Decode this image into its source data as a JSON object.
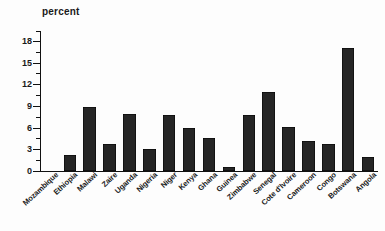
{
  "chart_data": {
    "type": "bar",
    "title": "",
    "subtitle": "",
    "xlabel": "",
    "ylabel": "percent",
    "ylim": [
      0,
      19.5
    ],
    "yticks": [
      0,
      3,
      6,
      9,
      12,
      15,
      18
    ],
    "ytick_labels": [
      "0",
      "3",
      "6",
      "9",
      "12",
      "15",
      "18"
    ],
    "grid": false,
    "legend": null,
    "legend_position": "none",
    "bar_color": "#262626",
    "axis_color": "#111111",
    "categories": [
      "Mozambique",
      "Ethiopia",
      "Malawi",
      "Zaire",
      "Uganda",
      "Nigeria",
      "Niger",
      "Kenya",
      "Ghana",
      "Guinea",
      "Zimbabwe",
      "Senegal",
      "Cote d'Ivoire",
      "Cameroon",
      "Congo",
      "Botswana",
      "Angola"
    ],
    "values": [
      0,
      2.2,
      8.9,
      3.7,
      7.9,
      3.1,
      7.7,
      6.0,
      4.5,
      0.6,
      7.8,
      10.9,
      6.1,
      4.2,
      3.8,
      17.0,
      1.9
    ],
    "annotations": []
  }
}
